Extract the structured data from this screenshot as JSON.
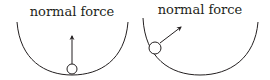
{
  "diagrams": [
    {
      "label": "normal force",
      "ball_position": "bottom",
      "arrow_direction": "up"
    },
    {
      "label": "normal force",
      "ball_position": "left-side",
      "arrow_direction": "up-right"
    }
  ],
  "colors": {
    "stroke": "#231f20",
    "background": "#ffffff"
  }
}
